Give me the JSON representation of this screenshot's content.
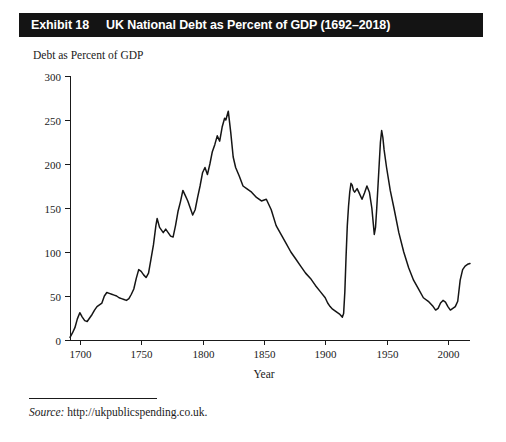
{
  "exhibit": {
    "label": "Exhibit 18",
    "title": "UK National Debt as Percent of GDP (1692–2018)"
  },
  "axis_caption": {
    "y": "Debt as Percent of GDP",
    "x": "Year"
  },
  "source": {
    "word": "Source:",
    "text": "http://ukpublicspending.co.uk."
  },
  "chart_data": {
    "type": "line",
    "title": "UK National Debt as Percent of GDP (1692–2018)",
    "xlabel": "Year",
    "ylabel": "Debt as Percent of GDP",
    "xlim": [
      1692,
      2018
    ],
    "ylim": [
      0,
      300
    ],
    "xticks": [
      1700,
      1750,
      1800,
      1850,
      1900,
      1950,
      2000
    ],
    "yticks": [
      0,
      50,
      100,
      150,
      200,
      250,
      300
    ],
    "grid": false,
    "legend": null,
    "series": [
      {
        "name": "UK National Debt (% of GDP)",
        "color": "#151515",
        "x": [
          1692,
          1694,
          1696,
          1698,
          1700,
          1702,
          1704,
          1706,
          1708,
          1710,
          1712,
          1714,
          1716,
          1718,
          1720,
          1722,
          1724,
          1726,
          1728,
          1730,
          1732,
          1734,
          1736,
          1738,
          1740,
          1742,
          1744,
          1746,
          1748,
          1750,
          1752,
          1754,
          1756,
          1758,
          1760,
          1762,
          1763,
          1765,
          1768,
          1770,
          1772,
          1774,
          1776,
          1778,
          1780,
          1782,
          1784,
          1786,
          1788,
          1790,
          1792,
          1794,
          1796,
          1798,
          1800,
          1802,
          1804,
          1806,
          1808,
          1810,
          1812,
          1814,
          1816,
          1818,
          1819,
          1821,
          1823,
          1825,
          1827,
          1830,
          1833,
          1836,
          1840,
          1844,
          1848,
          1852,
          1856,
          1860,
          1864,
          1868,
          1872,
          1876,
          1880,
          1884,
          1888,
          1892,
          1896,
          1900,
          1902,
          1904,
          1906,
          1908,
          1910,
          1912,
          1914,
          1915,
          1916,
          1917,
          1918,
          1919,
          1920,
          1921,
          1922,
          1923,
          1924,
          1926,
          1928,
          1930,
          1932,
          1934,
          1936,
          1938,
          1940,
          1941,
          1942,
          1943,
          1944,
          1945,
          1946,
          1947,
          1948,
          1950,
          1953,
          1956,
          1960,
          1964,
          1968,
          1972,
          1976,
          1980,
          1984,
          1988,
          1990,
          1992,
          1994,
          1996,
          1998,
          2000,
          2002,
          2004,
          2006,
          2008,
          2010,
          2012,
          2014,
          2016,
          2018
        ],
        "y": [
          3,
          8,
          14,
          24,
          31,
          26,
          22,
          21,
          25,
          29,
          34,
          38,
          40,
          42,
          50,
          54,
          53,
          52,
          51,
          50,
          48,
          47,
          46,
          45,
          47,
          52,
          58,
          70,
          80,
          78,
          74,
          71,
          76,
          92,
          108,
          130,
          138,
          128,
          122,
          126,
          122,
          118,
          117,
          130,
          146,
          157,
          170,
          164,
          158,
          150,
          142,
          148,
          162,
          175,
          190,
          196,
          188,
          200,
          214,
          222,
          232,
          226,
          242,
          252,
          250,
          260,
          236,
          208,
          196,
          186,
          175,
          172,
          168,
          162,
          158,
          160,
          148,
          130,
          120,
          110,
          100,
          92,
          84,
          76,
          70,
          62,
          55,
          48,
          42,
          38,
          35,
          33,
          31,
          29,
          26,
          30,
          55,
          95,
          130,
          152,
          168,
          178,
          176,
          170,
          168,
          172,
          166,
          160,
          167,
          175,
          168,
          150,
          120,
          128,
          150,
          175,
          200,
          225,
          238,
          230,
          216,
          196,
          170,
          150,
          122,
          100,
          82,
          68,
          58,
          48,
          44,
          38,
          34,
          36,
          42,
          45,
          43,
          38,
          34,
          36,
          38,
          44,
          68,
          80,
          84,
          86,
          87
        ]
      }
    ],
    "annotations": []
  },
  "plot_geometry": {
    "left": 70,
    "right": 470,
    "top": 76,
    "bottom": 340
  }
}
